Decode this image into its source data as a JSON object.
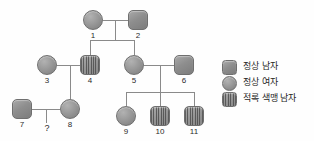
{
  "diagram": {
    "type": "pedigree",
    "generations": 3,
    "individuals": [
      {
        "id": "1",
        "label": "1",
        "sex": "female",
        "shape": "circle",
        "status": "normal",
        "x": 83,
        "y": 10,
        "gen": 1
      },
      {
        "id": "2",
        "label": "2",
        "sex": "male",
        "shape": "square",
        "status": "normal",
        "x": 128,
        "y": 10,
        "gen": 1
      },
      {
        "id": "3",
        "label": "3",
        "sex": "female",
        "shape": "circle",
        "status": "normal",
        "x": 37,
        "y": 55,
        "gen": 2
      },
      {
        "id": "4",
        "label": "4",
        "sex": "male",
        "shape": "square",
        "status": "colorblind",
        "x": 80,
        "y": 55,
        "gen": 2
      },
      {
        "id": "5",
        "label": "5",
        "sex": "female",
        "shape": "circle",
        "status": "normal",
        "x": 124,
        "y": 55,
        "gen": 2
      },
      {
        "id": "6",
        "label": "6",
        "sex": "male",
        "shape": "square",
        "status": "normal",
        "x": 174,
        "y": 55,
        "gen": 2
      },
      {
        "id": "7",
        "label": "7",
        "sex": "male",
        "shape": "square",
        "status": "normal",
        "x": 12,
        "y": 99,
        "gen": 3
      },
      {
        "id": "8",
        "label": "8",
        "sex": "female",
        "shape": "circle",
        "status": "normal",
        "x": 60,
        "y": 99,
        "gen": 3
      },
      {
        "id": "9",
        "label": "9",
        "sex": "female",
        "shape": "circle",
        "status": "normal",
        "x": 116,
        "y": 106,
        "gen": 3
      },
      {
        "id": "10",
        "label": "10",
        "sex": "male",
        "shape": "square",
        "status": "colorblind",
        "x": 150,
        "y": 106,
        "gen": 3
      },
      {
        "id": "11",
        "label": "11",
        "sex": "male",
        "shape": "square",
        "status": "colorblind",
        "x": 184,
        "y": 106,
        "gen": 3
      }
    ],
    "unknown_offspring_marker": "?",
    "matings": [
      {
        "partners": [
          "1",
          "2"
        ],
        "children": [
          "4",
          "5"
        ]
      },
      {
        "partners": [
          "3",
          "4"
        ],
        "children": [
          "8"
        ]
      },
      {
        "partners": [
          "5",
          "6"
        ],
        "children": [
          "9",
          "10",
          "11"
        ]
      },
      {
        "partners": [
          "7",
          "8"
        ],
        "children": [
          "?"
        ]
      }
    ]
  },
  "legend": {
    "items": [
      {
        "key": "normal-male-key",
        "shape": "square",
        "label": "정상 남자"
      },
      {
        "key": "normal-female-key",
        "shape": "circle",
        "label": "정상 여자"
      },
      {
        "key": "colorblind-male-key",
        "shape": "square-hatch",
        "label": "적록 색맹 남자"
      }
    ]
  },
  "colors": {
    "symbol_fill": "#8e8e8e",
    "symbol_stroke": "#6f6f6f",
    "line": "#8a8a8a",
    "text": "#1e1e1e",
    "background": "#fefefe"
  }
}
